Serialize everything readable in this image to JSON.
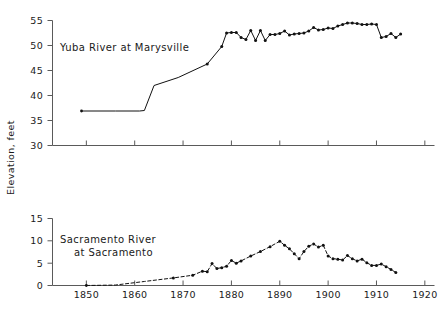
{
  "figure": {
    "background": "#ffffff",
    "ink_color": "#111111",
    "axis_color": "#5a5a5a"
  },
  "shared": {
    "xlabel": "",
    "xticks": [
      1850,
      1860,
      1870,
      1880,
      1890,
      1900,
      1910,
      1920
    ],
    "xtick_labels": [
      "1850",
      "1860",
      "1870",
      "1880",
      "1890",
      "1900",
      "1910",
      "1920"
    ],
    "xlim": [
      1843,
      1922
    ],
    "ylabel": "Elevation, feet"
  },
  "chart_data": [
    {
      "type": "line",
      "title": "Yuba River at Marysville",
      "xlabel": "",
      "ylabel": "Elevation, feet",
      "xlim": [
        1843,
        1922
      ],
      "ylim": [
        30,
        55
      ],
      "yticks": [
        30,
        35,
        40,
        45,
        50,
        55
      ],
      "ytick_labels": [
        "30",
        "35",
        "40",
        "45",
        "50",
        "55"
      ],
      "grid": false,
      "legend": "none",
      "linestyle": "solid",
      "x": [
        1849,
        1856,
        1861,
        1862,
        1864,
        1869,
        1875,
        1878,
        1879,
        1880,
        1881,
        1882,
        1883,
        1884,
        1885,
        1886,
        1887,
        1888,
        1889,
        1890,
        1891,
        1892,
        1893,
        1894,
        1895,
        1896,
        1897,
        1898,
        1899,
        1900,
        1901,
        1902,
        1903,
        1904,
        1905,
        1906,
        1907,
        1908,
        1909,
        1910,
        1911,
        1912,
        1913,
        1914,
        1915
      ],
      "values": [
        36.9,
        36.9,
        36.9,
        37.0,
        42.0,
        43.6,
        46.3,
        49.8,
        52.5,
        52.6,
        52.6,
        51.6,
        51.2,
        53.0,
        51.0,
        53.0,
        51.0,
        52.2,
        52.2,
        52.4,
        52.9,
        52.1,
        52.3,
        52.4,
        52.5,
        52.9,
        53.6,
        53.1,
        53.2,
        53.5,
        53.4,
        53.9,
        54.2,
        54.5,
        54.5,
        54.4,
        54.2,
        54.2,
        54.3,
        54.2,
        51.6,
        51.8,
        52.4,
        51.6,
        52.3
      ],
      "markers_from_index": 6,
      "notes": "Isolated point at 1849; flat segment to ~1862, sharp rise 1862-1864, steady rise to 1880, plateau with annual dots thereafter."
    },
    {
      "type": "line",
      "title": "Sacramento River at Sacramento",
      "title_lines": [
        "Sacramento River",
        "at Sacramento"
      ],
      "xlabel": "",
      "ylabel": "",
      "xlim": [
        1843,
        1922
      ],
      "ylim": [
        0,
        15
      ],
      "yticks": [
        0,
        5,
        10,
        15
      ],
      "ytick_labels": [
        "0",
        "5",
        "10",
        "15"
      ],
      "grid": false,
      "legend": "none",
      "linestyle": "dashed",
      "x": [
        1850,
        1856,
        1862,
        1868,
        1872,
        1874,
        1875,
        1876,
        1877,
        1878,
        1879,
        1880,
        1881,
        1882,
        1884,
        1886,
        1888,
        1890,
        1891,
        1892,
        1893,
        1894,
        1895,
        1896,
        1897,
        1898,
        1899,
        1900,
        1901,
        1902,
        1903,
        1904,
        1905,
        1906,
        1907,
        1908,
        1909,
        1910,
        1911,
        1912,
        1913,
        1914
      ],
      "values": [
        0.0,
        0.1,
        0.9,
        1.7,
        2.3,
        3.2,
        3.1,
        4.9,
        3.8,
        4.0,
        4.3,
        5.6,
        5.0,
        5.5,
        6.6,
        7.6,
        8.7,
        9.9,
        9.0,
        8.2,
        7.1,
        6.0,
        7.6,
        8.8,
        9.3,
        8.6,
        9.0,
        6.6,
        6.0,
        5.9,
        5.7,
        6.7,
        6.0,
        5.5,
        5.9,
        5.1,
        4.5,
        4.5,
        4.8,
        4.2,
        3.6,
        2.9
      ],
      "markers_from_index": 3,
      "notes": "Dashed trace beginning near zero at 1850, rising to peak ~10 at 1890, secondary peak ~9.3 near 1897, declining to ~3 by 1914."
    }
  ]
}
